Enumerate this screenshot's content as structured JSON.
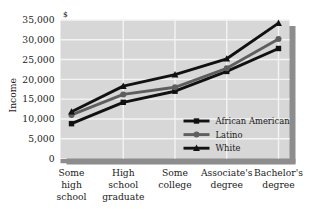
{
  "chart_data": {
    "type": "line",
    "title": "",
    "xlabel": "",
    "ylabel": "Income",
    "unit_label": "$",
    "categories": [
      "Some high school",
      "High school graduate",
      "Some college",
      "Associate's degree",
      "Bachelor's degree"
    ],
    "category_lines": [
      [
        "Some",
        "high",
        "school"
      ],
      [
        "High",
        "school",
        "graduate"
      ],
      [
        "Some",
        "college"
      ],
      [
        "Associate's",
        "degree"
      ],
      [
        "Bachelor's",
        "degree"
      ]
    ],
    "ylim": [
      0,
      35000
    ],
    "ytick_step": 5000,
    "ytick_labels": [
      "0",
      "5,000",
      "10,000",
      "15,000",
      "20,000",
      "25,000",
      "30,000",
      "35,000"
    ],
    "ytick_values": [
      0,
      5000,
      10000,
      15000,
      20000,
      25000,
      30000,
      35000
    ],
    "grid": true,
    "legend_position": "inside-bottom-right",
    "series": [
      {
        "name": "African American",
        "marker": "square",
        "color": "#111111",
        "values": [
          8800,
          14200,
          17000,
          22000,
          27800
        ]
      },
      {
        "name": "Latino",
        "marker": "circle",
        "color": "#5e5e5e",
        "values": [
          11000,
          16200,
          18000,
          22800,
          30200
        ]
      },
      {
        "name": "White",
        "marker": "triangle",
        "color": "#111111",
        "values": [
          11800,
          18300,
          21200,
          25200,
          34200
        ]
      }
    ]
  },
  "style": {
    "plot_background": "#d7d7d7",
    "gridline_color": "#f4f4f4",
    "shadow_color": "#8d8d8d",
    "page_background": "#ffffff"
  }
}
